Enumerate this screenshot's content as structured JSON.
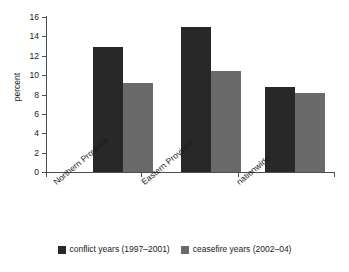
{
  "chart_data": {
    "type": "bar",
    "title": "",
    "subtitle": "",
    "xlabel": "",
    "ylabel": "percent",
    "ylim": [
      0,
      16
    ],
    "yticks": [
      0,
      2,
      4,
      6,
      8,
      10,
      12,
      14,
      16
    ],
    "ytick_labels": [
      "0",
      "2",
      "4",
      "6",
      "8",
      "10",
      "12",
      "14",
      "16"
    ],
    "grid": false,
    "legend_position": "bottom-center",
    "categories": [
      "Northern Province",
      "Eastern Province",
      "nationwide"
    ],
    "series": [
      {
        "name": "conflict years (1997–2001)",
        "color": "#282828",
        "values": [
          12.9,
          15.0,
          8.8
        ]
      },
      {
        "name": "ceasefire years (2002–04)",
        "color": "#6a6a6a",
        "values": [
          9.2,
          10.4,
          8.2
        ]
      }
    ]
  },
  "axis": {
    "y_title": "percent",
    "ticks": [
      {
        "label": "16",
        "value": 16
      },
      {
        "label": "14",
        "value": 14
      },
      {
        "label": "12",
        "value": 12
      },
      {
        "label": "10",
        "value": 10
      },
      {
        "label": "8",
        "value": 8
      },
      {
        "label": "6",
        "value": 6
      },
      {
        "label": "4",
        "value": 4
      },
      {
        "label": "2",
        "value": 2
      },
      {
        "label": "0",
        "value": 0
      }
    ]
  },
  "categories": [
    {
      "label": "Northern Province"
    },
    {
      "label": "Eastern Province"
    },
    {
      "label": "nationwide"
    }
  ],
  "legend": [
    {
      "label": "conflict years (1997–2001)",
      "color": "#282828"
    },
    {
      "label": "ceasefire years (2002–04)",
      "color": "#6a6a6a"
    }
  ]
}
